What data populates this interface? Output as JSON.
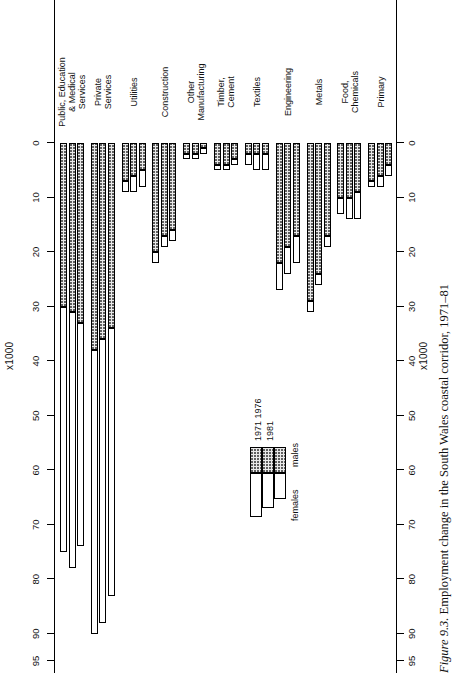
{
  "figure": {
    "number": "Figure 9.3.",
    "caption": "Employment change in the South Wales coastal corridor, 1971–81",
    "caption_line2": "Source: Census of Employment"
  },
  "axis": {
    "unit_label": "x1000",
    "unit_label_bottom": "x1000",
    "min": 0,
    "max": 95,
    "direction": "zero-at-right",
    "ticks": [
      0,
      10,
      20,
      30,
      40,
      50,
      60,
      70,
      80,
      90,
      95
    ],
    "tick_labels": [
      "0",
      "10",
      "20",
      "30",
      "40",
      "50",
      "60",
      "70",
      "80",
      "90",
      "95"
    ]
  },
  "legend": {
    "series": [
      {
        "name": "females",
        "label": "females",
        "fill": "white"
      },
      {
        "name": "males",
        "label": "males",
        "fill": "stipple"
      }
    ],
    "years": [
      "1971",
      "1976",
      "1981"
    ],
    "years_label": "1971 1976 1981"
  },
  "colors": {
    "ink": "#000000",
    "males_fill": "#e9e9e9",
    "females_fill": "#ffffff",
    "page": "#ffffff"
  },
  "chart_data": {
    "type": "bar",
    "orientation": "horizontal-stacked",
    "title": "Employment change in the South Wales coastal corridor, 1971–81",
    "xlabel": "x1000",
    "ylabel": "",
    "xlim": [
      0,
      95
    ],
    "grid": false,
    "legend_position": "inset-left",
    "unit": "thousands of employees",
    "categories": [
      "Primary",
      "Food, Chemicals",
      "Metals",
      "Engineering",
      "Textiles",
      "Timber, Cement",
      "Other Manufacturing",
      "Construction",
      "Utilities",
      "Private Services",
      "Public, Education & Medical Services"
    ],
    "category_lines": [
      [
        "Primary"
      ],
      [
        "Food,",
        "Chemicals"
      ],
      [
        "Metals"
      ],
      [
        "Engineering"
      ],
      [
        "Textiles"
      ],
      [
        "Timber,",
        "Cement"
      ],
      [
        "Other",
        "Manufacturing"
      ],
      [
        "Construction"
      ],
      [
        "Utilities"
      ],
      [
        "Private",
        "Services"
      ],
      [
        "Public, Education",
        "& Medical",
        "Services"
      ]
    ],
    "years": [
      "1971",
      "1976",
      "1981"
    ],
    "series": [
      {
        "name": "males",
        "values_by_year": {
          "1971": [
            7,
            10,
            29,
            22,
            2,
            4,
            2,
            20,
            7,
            38,
            30
          ],
          "1976": [
            6,
            10,
            24,
            19,
            2,
            4,
            2,
            17,
            6,
            36,
            31
          ],
          "1981": [
            4,
            9,
            17,
            17,
            2,
            3,
            1,
            16,
            5,
            34,
            33
          ]
        }
      },
      {
        "name": "females",
        "values_by_year": {
          "1971": [
            1,
            3,
            2,
            5,
            2,
            1,
            1,
            2,
            2,
            52,
            45
          ],
          "1976": [
            2,
            4,
            2,
            5,
            3,
            1,
            1,
            2,
            3,
            52,
            47
          ],
          "1981": [
            2,
            5,
            2,
            5,
            3,
            1,
            1,
            2,
            3,
            49,
            41
          ]
        }
      }
    ],
    "totals_by_year": {
      "1971": [
        8,
        13,
        31,
        27,
        4,
        5,
        3,
        22,
        9,
        90,
        75
      ],
      "1976": [
        8,
        14,
        26,
        24,
        5,
        5,
        3,
        19,
        9,
        88,
        78
      ],
      "1981": [
        6,
        14,
        19,
        22,
        5,
        4,
        2,
        18,
        8,
        83,
        74
      ]
    }
  }
}
